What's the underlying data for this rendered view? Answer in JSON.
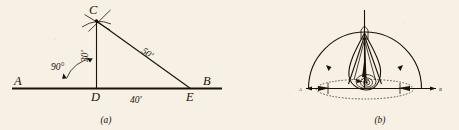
{
  "page": {
    "background_color": "#f6f1e4",
    "ink_color": "#1a1208",
    "width": 459,
    "height": 130
  },
  "figures": [
    {
      "id": "figure-a",
      "caption": "(a)",
      "description": "Right-triangle layout on baseline A-B with perpendicular erected at D",
      "baseline": {
        "left_label": "A",
        "right_label": "B"
      },
      "vertices": [
        {
          "name": "C",
          "label": "C"
        },
        {
          "name": "D",
          "label": "D"
        },
        {
          "name": "E",
          "label": "E"
        }
      ],
      "measurements": [
        {
          "name": "vertical-leg",
          "label": "30'",
          "from": "D",
          "to": "C"
        },
        {
          "name": "horizontal-leg",
          "label": "40'",
          "from": "D",
          "to": "E"
        },
        {
          "name": "hypotenuse",
          "label": "50'",
          "from": "C",
          "to": "E"
        }
      ],
      "angles": [
        {
          "name": "right-angle-at-D",
          "label": "90°"
        }
      ]
    },
    {
      "id": "figure-b",
      "caption": "(b)",
      "description": "Plan view of a surveying transit on a tripod set over the line, with semicircular arc of sight swung between the two range poles",
      "baseline": {
        "left_label": "A",
        "right_label": "B"
      },
      "elements": [
        {
          "name": "semicircular-arc",
          "label": ""
        },
        {
          "name": "transit-telescope",
          "label": ""
        },
        {
          "name": "tripod-legs",
          "label": ""
        },
        {
          "name": "range-pole-left",
          "label": ""
        },
        {
          "name": "range-pole-right",
          "label": ""
        }
      ]
    }
  ]
}
